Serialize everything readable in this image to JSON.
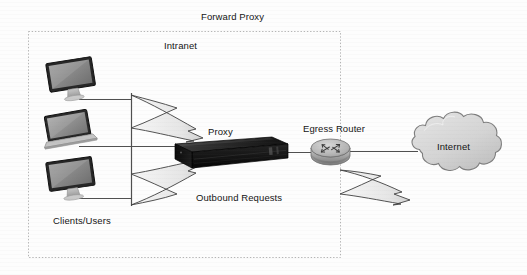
{
  "diagram": {
    "title": "Forward Proxy",
    "zone": {
      "label": "Intranet",
      "border_style": "dotted",
      "border_color": "#b9b9b9"
    },
    "nodes": [
      {
        "id": "client-monitor-top",
        "icon": "desktop-monitor-icon",
        "type": "client-device",
        "label": ""
      },
      {
        "id": "client-laptop-middle",
        "icon": "laptop-icon",
        "type": "client-device",
        "label": ""
      },
      {
        "id": "client-monitor-bottom",
        "icon": "desktop-monitor-icon",
        "type": "client-device",
        "label": ""
      },
      {
        "id": "proxy-server",
        "icon": "rack-server-icon",
        "type": "server",
        "label": "Proxy"
      },
      {
        "id": "egress-router",
        "icon": "router-icon",
        "type": "router",
        "label": "Egress Router"
      },
      {
        "id": "internet-cloud",
        "icon": "cloud-icon",
        "type": "network",
        "label": "Internet"
      }
    ],
    "labels": {
      "clients": "Clients/Users",
      "outbound": "Outbound Requests",
      "proxy": "Proxy",
      "egress_router": "Egress Router",
      "internet": "Internet",
      "intranet": "Intranet",
      "forward_proxy": "Forward Proxy"
    },
    "colors": {
      "text": "#141414",
      "line": "#5a5a5a",
      "zone_border": "#b9b9b9",
      "server_body": "#1c1c1c",
      "router_fill": "#b4b4b4",
      "cloud_fill": "#d6d6d6",
      "cloud_stroke": "#7d7d7d",
      "arrow_fill": "#ededed",
      "arrow_stroke": "#3a3a3a",
      "screen_fill": "#8e8e8e",
      "bezel_fill": "#2a2a2a",
      "page_background": "#fdfdfd"
    }
  }
}
